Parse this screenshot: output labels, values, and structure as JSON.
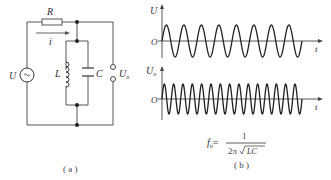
{
  "figure_a": {
    "caption": "( a )",
    "components": {
      "resistor": "R",
      "current": "i",
      "source": "U",
      "inductor": "L",
      "capacitor": "C",
      "output": "U",
      "output_sub": "o"
    }
  },
  "figure_b": {
    "caption": "( b )",
    "top_plot": {
      "ylabel": "U",
      "origin": "O",
      "xlabel": "t",
      "periods": 8
    },
    "bottom_plot": {
      "ylabel": "U",
      "ylabel_sub": "o",
      "origin": "O",
      "xlabel": "t",
      "periods": 15
    },
    "formula": {
      "lhs": "f",
      "lhs_sub": "n",
      "equals": "=",
      "numerator": "1",
      "denominator_prefix": "2π",
      "denominator_radicand": "LC"
    }
  },
  "colors": {
    "wire": "#555555",
    "wave": "#222222",
    "text": "#333333"
  }
}
